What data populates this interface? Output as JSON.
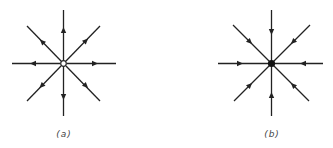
{
  "figure": {
    "panels": [
      {
        "id": "a",
        "label": "(a)",
        "center_type": "open-circle",
        "description": "Source: 8 radial field lines with arrows pointing outward",
        "arrow_direction": "outward",
        "center": [
          63.5,
          63.5
        ],
        "rays": 8
      },
      {
        "id": "b",
        "label": "(b)",
        "center_type": "filled-dot",
        "description": "Sink: 8 radial field lines with arrows pointing inward",
        "arrow_direction": "inward",
        "center": [
          271.5,
          63.5
        ],
        "rays": 8
      }
    ],
    "colors": {
      "line": "#222222",
      "background": "#ffffff",
      "label": "#444444"
    }
  }
}
